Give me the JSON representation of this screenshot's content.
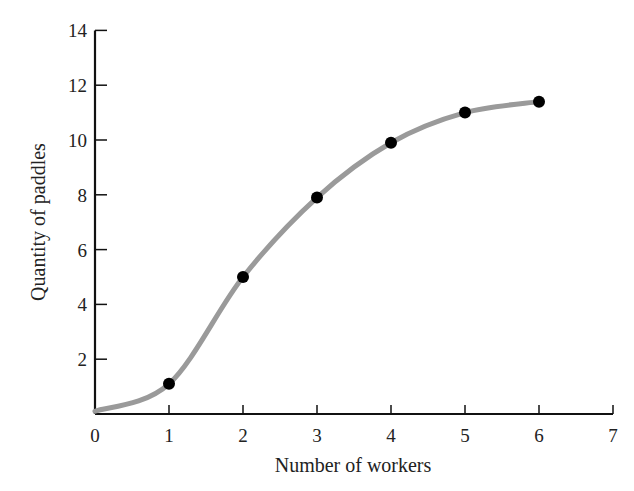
{
  "chart_data": {
    "type": "line",
    "title": "",
    "xlabel": "Number of workers",
    "ylabel": "Quantity of paddles",
    "x": [
      1,
      2,
      3,
      4,
      5,
      6
    ],
    "series": [
      {
        "name": "Total product",
        "values": [
          1.1,
          5,
          7.9,
          9.9,
          11,
          11.4
        ]
      }
    ],
    "curve_start": [
      0,
      0.1
    ],
    "xlim": [
      0,
      7
    ],
    "ylim": [
      0,
      14
    ],
    "xticks": [
      "0",
      "1",
      "2",
      "3",
      "4",
      "5",
      "6",
      "7"
    ],
    "yticks": [
      "2",
      "4",
      "6",
      "8",
      "10",
      "12",
      "14"
    ],
    "grid": false,
    "legend": "none",
    "colors": {
      "curve": "#9a9a9a",
      "points": "#000000",
      "axes": "#111111"
    }
  }
}
